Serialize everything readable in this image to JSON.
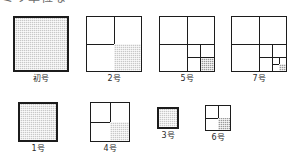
{
  "heading": {
    "text": "ミリ単位な",
    "note": "clipped heading text at top edge"
  },
  "colors": {
    "stroke": "#1c1c1c",
    "shade_light": "#c8c8c8",
    "shade_dark": "#9a9a9a",
    "background": "#ffffff",
    "caption": "#2a2a2a"
  },
  "figures": {
    "row_top": [
      {
        "id": "shogo",
        "caption": "初号",
        "levels": 0,
        "shaded": "whole",
        "size_px": 56
      },
      {
        "id": "2go",
        "caption": "2号",
        "levels": 1,
        "shaded": "bottom-right",
        "size_px": 56
      },
      {
        "id": "5go",
        "caption": "5号",
        "levels": 2,
        "shaded": "bottom-right",
        "size_px": 56
      },
      {
        "id": "7go",
        "caption": "7号",
        "levels": 3,
        "shaded": "bottom-right",
        "size_px": 56
      }
    ],
    "row_bottom": [
      {
        "id": "1go",
        "caption": "1号",
        "levels": 0,
        "shaded": "whole",
        "size_px": 40
      },
      {
        "id": "4go",
        "caption": "4号",
        "levels": 1,
        "shaded": "bottom-right",
        "size_px": 40
      },
      {
        "id": "3go",
        "caption": "3号",
        "levels": 0,
        "shaded": "whole",
        "size_px": 22
      },
      {
        "id": "6go",
        "caption": "6号",
        "levels": 1,
        "shaded": "bottom-right",
        "size_px": 26
      }
    ]
  }
}
